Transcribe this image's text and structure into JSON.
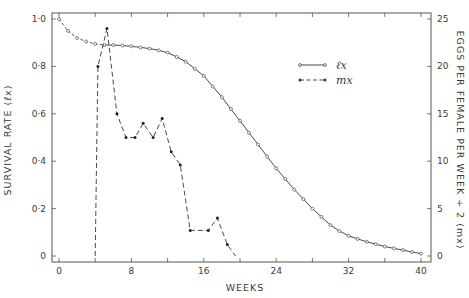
{
  "chart_data": {
    "type": "line",
    "title": "",
    "xlabel": "WEEKS",
    "ylabel": "SURVIVAL RATE (ℓx)",
    "y2label": "EGGS PER FEMALE PER WEEK ÷ 2 (mx)",
    "xlim": [
      0,
      40
    ],
    "ylim": [
      0,
      1.0
    ],
    "y2lim": [
      0,
      25
    ],
    "grid": false,
    "legend_position": "upper right (inside)",
    "x_ticks": [
      0,
      4,
      8,
      12,
      16,
      20,
      24,
      28,
      32,
      36,
      40
    ],
    "x_tick_labels": [
      "0",
      "8",
      "16",
      "24",
      "32",
      "40"
    ],
    "x_tick_label_values": [
      0,
      8,
      16,
      24,
      32,
      40
    ],
    "y_ticks": [
      0,
      0.2,
      0.4,
      0.6,
      0.8,
      1.0
    ],
    "y_tick_labels": [
      "0",
      "0·2",
      "0·4",
      "0·6",
      "0·8",
      "1·0"
    ],
    "y2_ticks": [
      0,
      5,
      10,
      15,
      20,
      25
    ],
    "y2_tick_labels": [
      "0",
      "5",
      "10",
      "15",
      "20",
      "25"
    ],
    "series": [
      {
        "name": "ℓx",
        "axis": "left",
        "style": "solid line with open circle markers (dashed from week 0 to ~5)",
        "x": [
          0,
          1,
          2,
          3,
          4,
          5,
          6,
          7,
          8,
          9,
          10,
          11,
          12,
          13,
          14,
          15,
          16,
          17,
          18,
          19,
          20,
          21,
          22,
          23,
          24,
          25,
          26,
          27,
          28,
          29,
          30,
          31,
          32,
          33,
          34,
          35,
          36,
          37,
          38,
          39,
          40
        ],
        "values": [
          1.0,
          0.95,
          0.92,
          0.905,
          0.895,
          0.89,
          0.89,
          0.888,
          0.885,
          0.88,
          0.875,
          0.868,
          0.858,
          0.84,
          0.82,
          0.79,
          0.76,
          0.715,
          0.67,
          0.62,
          0.57,
          0.52,
          0.47,
          0.42,
          0.37,
          0.325,
          0.28,
          0.24,
          0.2,
          0.165,
          0.13,
          0.105,
          0.085,
          0.072,
          0.06,
          0.05,
          0.04,
          0.032,
          0.025,
          0.017,
          0.01
        ]
      },
      {
        "name": "mx",
        "axis": "right",
        "style": "dashed line with filled dot markers",
        "x": [
          4.0,
          4.3,
          5.3,
          6.4,
          7.4,
          8.4,
          9.3,
          10.4,
          11.4,
          12.4,
          13.4,
          14.5,
          16.5,
          17.5,
          18.6,
          19.5
        ],
        "values": [
          0,
          20,
          24,
          15,
          12.5,
          12.5,
          14,
          12.5,
          14.5,
          11,
          9.6,
          2.7,
          2.7,
          4,
          1.2,
          0
        ]
      }
    ]
  },
  "legend": {
    "items": [
      {
        "label": "ℓx",
        "style": "solid"
      },
      {
        "label": "mx",
        "style": "dashed"
      }
    ]
  },
  "colors": {
    "line": "#4a4a4a",
    "text": "#3a3a3a",
    "axis": "#555555",
    "background": "#ffffff"
  }
}
